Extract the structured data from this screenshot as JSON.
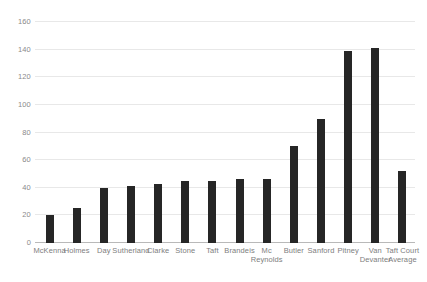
{
  "chart_data": {
    "type": "bar",
    "title": "",
    "subtitle": "",
    "xlabel": "",
    "ylabel": "",
    "ylim": [
      0,
      160
    ],
    "yticks": [
      0,
      20,
      40,
      60,
      80,
      100,
      120,
      140,
      160
    ],
    "grid": true,
    "legend": false,
    "bar_color": "#262626",
    "gridline_color": "#e8e8e8",
    "axis_color": "#b9b9b9",
    "tick_label_color": "#8a8a8a",
    "categories": [
      "McKenna",
      "Holmes",
      "Day",
      "Sutherland",
      "Clarke",
      "Stone",
      "Taft",
      "Brandeis",
      "Mc Reynolds",
      "Butler",
      "Sanford",
      "Pitney",
      "Van Devanter",
      "Taft Court Average"
    ],
    "category_lines": [
      [
        "McKenna",
        ""
      ],
      [
        "Holmes",
        ""
      ],
      [
        "Day",
        ""
      ],
      [
        "Sutherland",
        ""
      ],
      [
        "Clarke",
        ""
      ],
      [
        "Stone",
        ""
      ],
      [
        "Taft",
        ""
      ],
      [
        "Brandeis",
        ""
      ],
      [
        "Mc",
        "Reynolds"
      ],
      [
        "Butler",
        ""
      ],
      [
        "Sanford",
        ""
      ],
      [
        "Pitney",
        ""
      ],
      [
        "Van",
        "Devanter"
      ],
      [
        "Taft Court",
        "Average"
      ]
    ],
    "values": [
      20,
      25,
      40,
      41,
      43,
      45,
      45,
      46,
      46,
      70,
      90,
      139,
      141,
      52
    ]
  }
}
